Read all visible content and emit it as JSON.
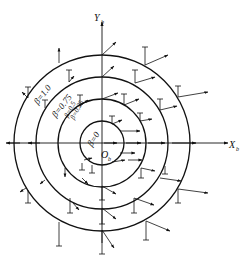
{
  "diagram": {
    "type": "vector-field-concentric-circles",
    "origin_label": "O",
    "origin_subscript": "b",
    "x_axis_label": "X",
    "x_axis_subscript": "b",
    "y_axis_label": "Y",
    "y_axis_subscript": "b",
    "circles": [
      {
        "label": "β=0",
        "beta": 0,
        "radius": 22
      },
      {
        "label": "β=0.25",
        "beta": 0.25,
        "radius": 22
      },
      {
        "label": "β=0.5",
        "beta": 0.5,
        "radius": 44
      },
      {
        "label": "β=0.75",
        "beta": 0.75,
        "radius": 66
      },
      {
        "label": "β=1.0",
        "beta": 1.0,
        "radius": 88
      }
    ],
    "labels": {
      "beta_0": "β=0",
      "beta_025": "β=0.25",
      "beta_05": "β=0.5",
      "beta_075": "β=0.75",
      "beta_10": "β=1.0"
    },
    "colors": {
      "line": "#111111",
      "background": "#ffffff"
    }
  }
}
